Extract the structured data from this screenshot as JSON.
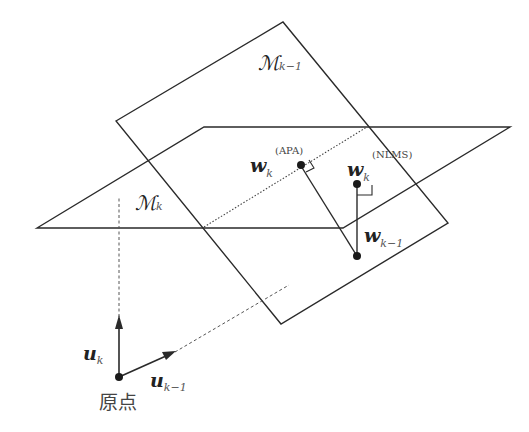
{
  "diagram": {
    "type": "geometric-projection",
    "planes": [
      {
        "id": "M_k_minus_1",
        "label": "ℳ",
        "subscript": "k−1"
      },
      {
        "id": "M_k",
        "label": "ℳ",
        "subscript": "k"
      }
    ],
    "points": {
      "w_apa": {
        "label": "w",
        "subscript": "k",
        "superscript": "(APA)"
      },
      "w_nlms": {
        "label": "w",
        "subscript": "k",
        "superscript": "(NLMS)"
      },
      "w_prev": {
        "label": "w",
        "subscript": "k−1"
      },
      "origin": {
        "label": "原点"
      }
    },
    "vectors": {
      "u_k": {
        "label": "u",
        "subscript": "k"
      },
      "u_k_minus_1": {
        "label": "u",
        "subscript": "k−1"
      }
    },
    "colors": {
      "line": "#2a2a2a",
      "dashed": "#555555",
      "text": "#222222"
    }
  }
}
